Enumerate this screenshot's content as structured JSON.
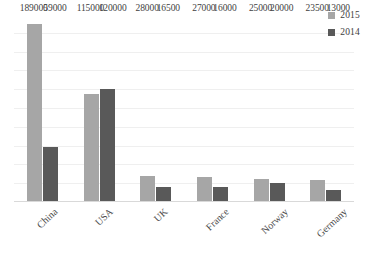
{
  "chart_data": {
    "type": "bar",
    "title": "",
    "subtitle": "",
    "xlabel": "",
    "ylabel": "",
    "categories": [
      "China",
      "USA",
      "UK",
      "France",
      "Norway",
      "Germany"
    ],
    "series": [
      {
        "name": "2015",
        "color": "#a6a6a6",
        "values": [
          189000,
          115000,
          28000,
          27000,
          25000,
          23500
        ]
      },
      {
        "name": "2014",
        "color": "#595959",
        "values": [
          59000,
          120000,
          16500,
          16000,
          20000,
          13000
        ]
      }
    ],
    "ylim": [
      0,
      200000
    ],
    "grid": true,
    "gridline_values": [
      20000,
      40000,
      60000,
      80000,
      100000,
      120000,
      140000,
      160000,
      180000
    ],
    "y_tick_labels_visible": false,
    "data_labels_visible": true,
    "legend_position": "top-right",
    "bar_orientation": "vertical",
    "grouping": "clustered"
  },
  "legend": {
    "items": [
      {
        "label": "2015",
        "color": "#a6a6a6",
        "swatch_name": "legend-swatch-2015"
      },
      {
        "label": "2014",
        "color": "#595959",
        "swatch_name": "legend-swatch-2014"
      }
    ]
  },
  "colors": {
    "series_2015": "#a6a6a6",
    "series_2014": "#595959",
    "gridline": "#efefef",
    "axis_line": "#d9d9d9",
    "label_text": "#3f3f3f",
    "background": "#ffffff"
  }
}
